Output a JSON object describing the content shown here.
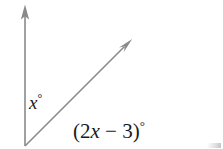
{
  "figure": {
    "background_color": "#ffffff",
    "width": 223,
    "height": 149,
    "stroke_color": "#8a8a8a",
    "text_color": "#1a1a1a"
  },
  "geometry": {
    "vertex": {
      "x": 25,
      "y": 146
    },
    "rays": [
      {
        "name": "vertical-ray",
        "from": {
          "x": 25,
          "y": 146
        },
        "to": {
          "x": 25,
          "y": 5
        },
        "arrowhead": "at-end",
        "direction": "up"
      },
      {
        "name": "diagonal-ray",
        "from": {
          "x": 25,
          "y": 146
        },
        "to": {
          "x": 132,
          "y": 39
        },
        "arrowhead": "at-end",
        "direction": "up-right"
      }
    ]
  },
  "labels": {
    "angle_x": {
      "text": "x",
      "degree_symbol": "°",
      "full": "x°",
      "position": {
        "x": 29,
        "y": 93
      },
      "describes": "angle between vertical ray and diagonal ray"
    },
    "angle_expression": {
      "open_paren": "(",
      "coefficient": "2",
      "variable": "x",
      "operator": "−",
      "constant": "3",
      "close_paren": ")",
      "degree_symbol": "°",
      "full": "(2x − 3)°",
      "position": {
        "x": 73,
        "y": 119
      },
      "describes": "angle between diagonal ray and the region below it"
    }
  }
}
